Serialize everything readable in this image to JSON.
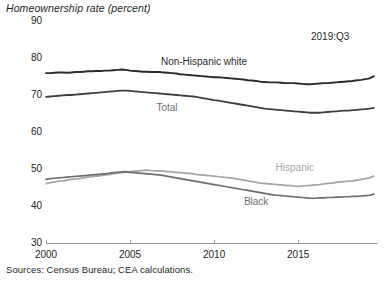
{
  "chart_data": {
    "type": "line",
    "title": "Homeownership rate (percent)",
    "xlabel": "",
    "ylabel": "Homeownership rate (percent)",
    "ylim": [
      30,
      90
    ],
    "yticks": [
      30,
      40,
      50,
      60,
      70,
      80,
      90
    ],
    "xlim": [
      2000,
      2019.75
    ],
    "xticks": [
      2000,
      2005,
      2010,
      2015
    ],
    "xtick_labels": [
      "2000",
      "2005",
      "2010",
      "2015"
    ],
    "grid": false,
    "legend_position": "inline-annotations",
    "annotation": "2019:Q3",
    "source": "Sources: Census Bureau; CEA calculations.",
    "x": [
      2000,
      2000.25,
      2000.5,
      2000.75,
      2001,
      2001.25,
      2001.5,
      2001.75,
      2002,
      2002.25,
      2002.5,
      2002.75,
      2003,
      2003.25,
      2003.5,
      2003.75,
      2004,
      2004.25,
      2004.5,
      2004.75,
      2005,
      2005.25,
      2005.5,
      2005.75,
      2006,
      2006.25,
      2006.5,
      2006.75,
      2007,
      2007.25,
      2007.5,
      2007.75,
      2008,
      2008.25,
      2008.5,
      2008.75,
      2009,
      2009.25,
      2009.5,
      2009.75,
      2010,
      2010.25,
      2010.5,
      2010.75,
      2011,
      2011.25,
      2011.5,
      2011.75,
      2012,
      2012.25,
      2012.5,
      2012.75,
      2013,
      2013.25,
      2013.5,
      2013.75,
      2014,
      2014.25,
      2014.5,
      2014.75,
      2015,
      2015.25,
      2015.5,
      2015.75,
      2016,
      2016.25,
      2016.5,
      2016.75,
      2017,
      2017.25,
      2017.5,
      2017.75,
      2018,
      2018.25,
      2018.5,
      2018.75,
      2019,
      2019.25,
      2019.5
    ],
    "series": [
      {
        "name": "Non-Hispanic white",
        "color": "#2b2b2b",
        "label_color": "#2b2b2b",
        "label_x": 2009.4,
        "label_y": 79.0,
        "values": [
          75.9,
          75.9,
          76.0,
          76.1,
          76.1,
          76.0,
          76.1,
          76.2,
          76.2,
          76.3,
          76.4,
          76.4,
          76.5,
          76.5,
          76.6,
          76.6,
          76.7,
          76.8,
          76.9,
          76.8,
          76.6,
          76.5,
          76.4,
          76.3,
          76.3,
          76.2,
          76.2,
          76.2,
          76.1,
          76.0,
          75.9,
          75.8,
          75.6,
          75.5,
          75.4,
          75.3,
          75.2,
          75.1,
          75.0,
          74.9,
          74.8,
          74.8,
          74.7,
          74.6,
          74.5,
          74.4,
          74.3,
          74.2,
          74.0,
          73.9,
          73.8,
          73.6,
          73.5,
          73.4,
          73.4,
          73.4,
          73.3,
          73.2,
          73.2,
          73.2,
          73.1,
          73.0,
          72.9,
          72.9,
          73.0,
          73.1,
          73.2,
          73.2,
          73.3,
          73.4,
          73.5,
          73.6,
          73.7,
          73.8,
          74.0,
          74.1,
          74.3,
          74.5,
          75.1
        ]
      },
      {
        "name": "Total",
        "color": "#3f3f3f",
        "label_color": "#6e6e6e",
        "label_x": 2007.2,
        "label_y": 66.6,
        "values": [
          69.5,
          69.6,
          69.7,
          69.8,
          69.9,
          70.0,
          70.0,
          70.1,
          70.2,
          70.3,
          70.4,
          70.5,
          70.6,
          70.7,
          70.8,
          70.9,
          71.0,
          71.1,
          71.2,
          71.2,
          71.1,
          71.0,
          70.9,
          70.8,
          70.7,
          70.6,
          70.5,
          70.4,
          70.3,
          70.2,
          70.1,
          70.0,
          69.9,
          69.8,
          69.7,
          69.6,
          69.4,
          69.2,
          69.0,
          68.8,
          68.6,
          68.5,
          68.3,
          68.1,
          67.9,
          67.7,
          67.5,
          67.3,
          67.1,
          66.9,
          66.7,
          66.5,
          66.3,
          66.2,
          66.1,
          66.0,
          65.9,
          65.8,
          65.7,
          65.6,
          65.5,
          65.4,
          65.3,
          65.2,
          65.2,
          65.2,
          65.3,
          65.4,
          65.5,
          65.6,
          65.7,
          65.8,
          65.8,
          65.9,
          66.0,
          66.1,
          66.2,
          66.3,
          66.5
        ]
      },
      {
        "name": "Hispanic",
        "color": "#a5a5a5",
        "label_color": "#a5a5a5",
        "label_x": 2014.8,
        "label_y": 50.3,
        "values": [
          46.0,
          46.3,
          46.5,
          46.7,
          46.8,
          47.0,
          47.2,
          47.3,
          47.4,
          47.6,
          47.8,
          47.9,
          48.1,
          48.2,
          48.4,
          48.5,
          48.7,
          48.9,
          49.0,
          49.1,
          49.3,
          49.4,
          49.5,
          49.6,
          49.7,
          49.6,
          49.5,
          49.5,
          49.4,
          49.3,
          49.2,
          49.1,
          49.0,
          48.9,
          48.8,
          48.7,
          48.5,
          48.4,
          48.3,
          48.2,
          48.1,
          47.9,
          47.8,
          47.7,
          47.6,
          47.4,
          47.2,
          47.0,
          46.8,
          46.6,
          46.4,
          46.2,
          46.1,
          46.0,
          45.9,
          45.8,
          45.7,
          45.6,
          45.5,
          45.4,
          45.3,
          45.4,
          45.5,
          45.6,
          45.7,
          45.8,
          46.0,
          46.1,
          46.2,
          46.4,
          46.5,
          46.6,
          46.7,
          46.8,
          47.0,
          47.2,
          47.4,
          47.6,
          48.1
        ]
      },
      {
        "name": "Black",
        "color": "#6e6e6e",
        "label_color": "#6e6e6e",
        "label_x": 2012.5,
        "label_y": 41.2,
        "values": [
          47.2,
          47.4,
          47.5,
          47.6,
          47.7,
          47.8,
          47.9,
          48.0,
          48.1,
          48.2,
          48.3,
          48.4,
          48.5,
          48.6,
          48.7,
          48.8,
          49.0,
          49.1,
          49.2,
          49.3,
          49.1,
          49.0,
          48.9,
          48.8,
          48.7,
          48.6,
          48.5,
          48.4,
          48.2,
          48.0,
          47.8,
          47.6,
          47.4,
          47.2,
          47.0,
          46.8,
          46.6,
          46.4,
          46.2,
          46.0,
          45.8,
          45.6,
          45.4,
          45.2,
          45.0,
          44.8,
          44.6,
          44.4,
          44.2,
          44.0,
          43.8,
          43.6,
          43.4,
          43.2,
          43.0,
          42.9,
          42.8,
          42.7,
          42.6,
          42.5,
          42.4,
          42.3,
          42.2,
          42.1,
          42.1,
          42.2,
          42.2,
          42.3,
          42.3,
          42.4,
          42.4,
          42.5,
          42.5,
          42.6,
          42.6,
          42.7,
          42.8,
          42.9,
          43.2
        ]
      }
    ]
  },
  "axis": {
    "title": "Homeownership rate (percent)",
    "y_labels": [
      "90",
      "80",
      "70",
      "60",
      "50",
      "40",
      "30"
    ],
    "x_labels": [
      "2000",
      "2005",
      "2010",
      "2015"
    ]
  },
  "annotations": {
    "date_stamp": "2019:Q3",
    "series_labels": [
      "Non-Hispanic white",
      "Total",
      "Hispanic",
      "Black"
    ]
  },
  "footer": {
    "source": "Sources: Census Bureau; CEA calculations."
  },
  "colors": {
    "non_hispanic_white": "#2b2b2b",
    "total": "#3f3f3f",
    "hispanic": "#a5a5a5",
    "black": "#6e6e6e",
    "axis": "#9b9b9b",
    "text": "#231f20"
  }
}
